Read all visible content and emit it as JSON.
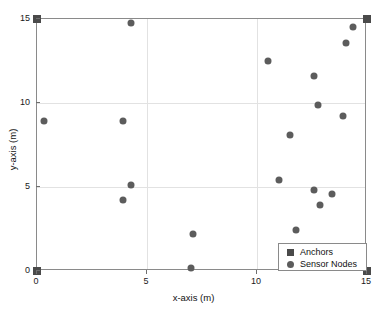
{
  "chart_data": {
    "type": "scatter",
    "title": "",
    "xlabel": "x-axis (m)",
    "ylabel": "y-axis (m)",
    "xlim": [
      0,
      15
    ],
    "ylim": [
      0,
      15
    ],
    "xticks": [
      0,
      5,
      10,
      15
    ],
    "yticks": [
      0,
      5,
      10,
      15
    ],
    "xticklabels": [
      "0",
      "5",
      "10",
      "15"
    ],
    "yticklabels": [
      "0",
      "5",
      "10",
      "15"
    ],
    "grid": true,
    "legend_position": "lower right",
    "series": [
      {
        "name": "Anchors",
        "marker": "square",
        "color": "#4a4a4a",
        "points": [
          {
            "x": 0.0,
            "y": 15.0
          },
          {
            "x": 15.0,
            "y": 15.0
          },
          {
            "x": 0.0,
            "y": 0.0
          },
          {
            "x": 15.0,
            "y": 0.0
          }
        ]
      },
      {
        "name": "Sensor Nodes",
        "marker": "circle",
        "color": "#5c5c5c",
        "points": [
          {
            "x": 4.25,
            "y": 14.75
          },
          {
            "x": 14.35,
            "y": 14.55
          },
          {
            "x": 14.05,
            "y": 13.6
          },
          {
            "x": 10.5,
            "y": 12.5
          },
          {
            "x": 12.6,
            "y": 11.6
          },
          {
            "x": 12.75,
            "y": 9.9
          },
          {
            "x": 13.9,
            "y": 9.2
          },
          {
            "x": 0.3,
            "y": 8.9
          },
          {
            "x": 3.9,
            "y": 8.9
          },
          {
            "x": 11.5,
            "y": 8.1
          },
          {
            "x": 11.0,
            "y": 5.4
          },
          {
            "x": 12.6,
            "y": 4.85
          },
          {
            "x": 13.4,
            "y": 4.6
          },
          {
            "x": 4.25,
            "y": 5.1
          },
          {
            "x": 12.85,
            "y": 3.95
          },
          {
            "x": 3.9,
            "y": 4.2
          },
          {
            "x": 11.75,
            "y": 2.45
          },
          {
            "x": 7.1,
            "y": 2.2
          },
          {
            "x": 7.0,
            "y": 0.15
          }
        ]
      }
    ]
  },
  "legend": {
    "entries": [
      {
        "label": "Anchors",
        "icon": "square-marker-icon"
      },
      {
        "label": "Sensor Nodes",
        "icon": "circle-marker-icon"
      }
    ]
  }
}
